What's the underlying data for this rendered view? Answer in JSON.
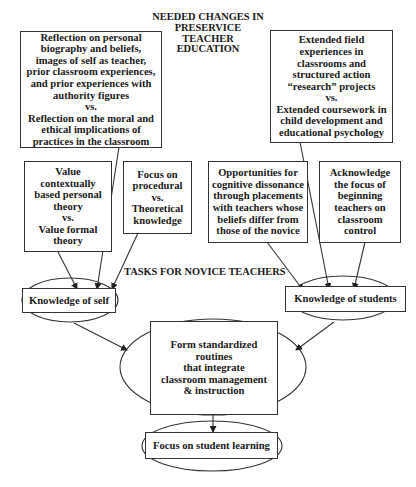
{
  "title": {
    "lines": [
      "NEEDED CHANGES IN",
      "PRESERVICE",
      "TEACHER",
      "EDUCATION"
    ]
  },
  "section_label": "TASKS FOR NOVICE TEACHERS",
  "boxes": {
    "reflection": {
      "lines": [
        "Reflection on personal",
        "biography and beliefs,",
        "images of self as teacher,",
        "prior classroom experiences,",
        "and prior experiences with",
        "authority figures",
        "vs.",
        "Reflection on the moral and",
        "ethical implications of",
        "practices in the classroom"
      ]
    },
    "field_experiences": {
      "lines": [
        "Extended field",
        "experiences in",
        "classrooms and",
        "structured action",
        "“research” projects",
        "vs.",
        "Extended coursework in",
        "child development and",
        "educational psychology"
      ]
    },
    "value_theory": {
      "lines": [
        "Value",
        "contextually",
        "based personal",
        "theory",
        "vs.",
        "Value formal",
        "theory"
      ]
    },
    "procedural": {
      "lines": [
        "Focus on",
        "procedural",
        "vs.",
        "Theoretical",
        "knowledge"
      ]
    },
    "cognitive_dissonance": {
      "lines": [
        "Opportunities for",
        "cognitive dissonance",
        "through placements",
        "with teachers whose",
        "beliefs differ from",
        "those of the novice"
      ]
    },
    "classroom_control": {
      "lines": [
        "Acknowledge",
        "the focus of",
        "beginning",
        "teachers on",
        "classroom",
        "control"
      ]
    }
  },
  "nodes": {
    "knowledge_self": {
      "label": "Knowledge of self"
    },
    "knowledge_students": {
      "label": "Knowledge of students"
    },
    "routines": {
      "lines": [
        "Form standardized",
        "routines",
        "that integrate",
        "classroom management",
        "& instruction"
      ]
    },
    "student_learning": {
      "label": "Focus on student learning"
    }
  },
  "edges": [
    {
      "from": "reflection",
      "to": "knowledge_self"
    },
    {
      "from": "value_theory",
      "to": "knowledge_self"
    },
    {
      "from": "procedural",
      "to": "knowledge_self"
    },
    {
      "from": "field_experiences",
      "to": "knowledge_students"
    },
    {
      "from": "cognitive_dissonance",
      "to": "knowledge_students"
    },
    {
      "from": "classroom_control",
      "to": "knowledge_students"
    },
    {
      "from": "knowledge_self",
      "to": "routines"
    },
    {
      "from": "knowledge_students",
      "to": "routines"
    },
    {
      "from": "routines",
      "to": "student_learning"
    }
  ],
  "colors": {
    "stroke": "#333333",
    "text": "#1a1a1a",
    "background": "#ffffff"
  }
}
